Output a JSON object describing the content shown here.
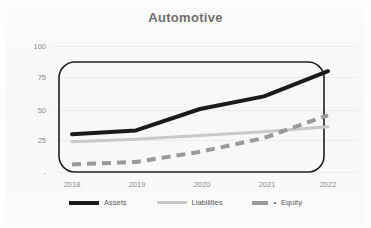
{
  "chart_data": {
    "type": "line",
    "title": "Automotive",
    "xlabel": "",
    "ylabel": "",
    "x": [
      "2018",
      "2019",
      "2020",
      "2021",
      "2022"
    ],
    "categories": [
      "2018",
      "2019",
      "2020",
      "2021",
      "2022"
    ],
    "ylim": [
      0,
      100
    ],
    "yticks": [
      "-",
      "25",
      "50",
      "75",
      "100"
    ],
    "ytick_values": [
      0,
      25,
      50,
      75,
      100
    ],
    "grid": true,
    "legend_position": "bottom",
    "series": [
      {
        "name": "Assets",
        "values": [
          30,
          33,
          50,
          60,
          80
        ],
        "color": "#1a1a1a",
        "style": "solid",
        "width": 4
      },
      {
        "name": "Liabilities",
        "values": [
          24,
          26,
          29,
          32,
          36
        ],
        "color": "#c9c9c9",
        "style": "solid",
        "width": 3
      },
      {
        "name": "Equity",
        "values": [
          6,
          8,
          16,
          27,
          45
        ],
        "color": "#9a9a9a",
        "style": "dashed",
        "width": 4
      }
    ]
  },
  "title": {
    "text": "Automotive"
  },
  "axes": {
    "y": {
      "ticks": [
        "100",
        "75",
        "50",
        "25",
        "-"
      ]
    },
    "x": {
      "ticks": [
        "2018",
        "2019",
        "2020",
        "2021",
        "2022"
      ]
    }
  },
  "legend": {
    "items": [
      {
        "label": "Assets",
        "swatch": "line-solid-black-icon"
      },
      {
        "label": "Liabilities",
        "swatch": "line-solid-gray-icon"
      },
      {
        "label": "Equity",
        "swatch": "line-dashed-gray-icon",
        "prefix": "•"
      }
    ]
  },
  "colors": {
    "assets": "#1a1a1a",
    "liabilities": "#c9c9c9",
    "equity": "#9a9a9a",
    "grid": "#ececec",
    "text": "#8a8a8a",
    "frame": "#1f1f1f"
  }
}
